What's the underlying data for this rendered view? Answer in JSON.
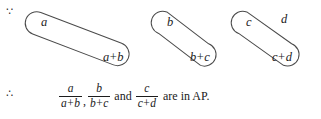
{
  "symbols": {
    "because": "∵",
    "therefore": "∴"
  },
  "diagram": {
    "type": "grouping-braces",
    "stroke_color": "#4a4a4a",
    "groups": [
      {
        "numerator": "a",
        "denominator_first": "a",
        "denominator_op": "+",
        "denominator_second": "b"
      },
      {
        "numerator": "b",
        "denominator_first": "b",
        "denominator_op": "+",
        "denominator_second": "c"
      },
      {
        "numerator": "c",
        "denominator_first": "c",
        "denominator_op": "+",
        "denominator_second": "d"
      }
    ],
    "trailing_term": "d"
  },
  "conclusion": {
    "fractions": [
      {
        "numerator": "a",
        "den_first": "a",
        "den_op": "+",
        "den_second": "b"
      },
      {
        "numerator": "b",
        "den_first": "b",
        "den_op": "+",
        "den_second": "c"
      },
      {
        "numerator": "c",
        "den_first": "c",
        "den_op": "+",
        "den_second": "d"
      }
    ],
    "comma": ",",
    "conjunction": "and",
    "tail": "are in AP."
  }
}
